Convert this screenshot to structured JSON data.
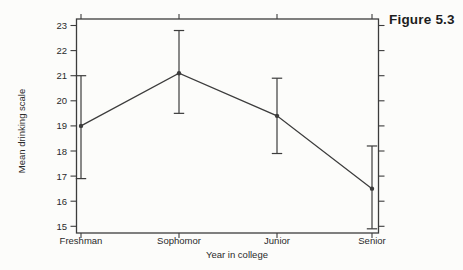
{
  "figure_label": "Figure 5.3",
  "chart_data": {
    "type": "line",
    "title": "",
    "xlabel": "Year in college",
    "ylabel": "Mean drinking scale",
    "categories": [
      "Freshman",
      "Sophomor",
      "Junior",
      "Senior"
    ],
    "series": [
      {
        "name": "Mean drinking scale",
        "values": [
          19.0,
          21.1,
          19.4,
          16.5
        ],
        "error_low": [
          16.9,
          19.5,
          17.9,
          14.9
        ],
        "error_high": [
          21.0,
          22.8,
          20.9,
          18.2
        ]
      }
    ],
    "ylim": [
      15,
      23
    ],
    "yticks": [
      23,
      22,
      21,
      20,
      19,
      18,
      17,
      16,
      15
    ],
    "grid": false,
    "error_bars": true,
    "marker": "filled-circle",
    "legend": "none",
    "colors": {
      "line": "#3c3c3c",
      "text": "#2a2a2a",
      "background": "#fcfcfa",
      "figure_label": "#1d1d1d"
    }
  }
}
